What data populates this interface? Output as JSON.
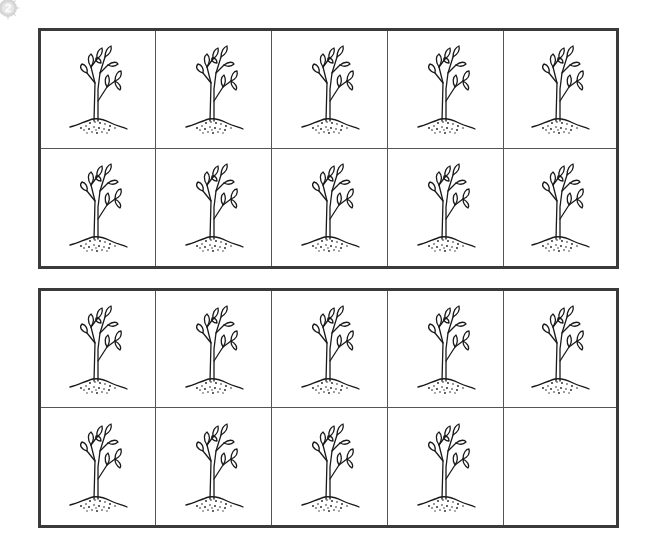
{
  "badge": {
    "label": "2",
    "icon": "sun-badge-icon"
  },
  "frames": [
    {
      "name": "ten-frame-1",
      "cells": [
        {
          "filled": true
        },
        {
          "filled": true
        },
        {
          "filled": true
        },
        {
          "filled": true
        },
        {
          "filled": true
        },
        {
          "filled": true
        },
        {
          "filled": true
        },
        {
          "filled": true
        },
        {
          "filled": true
        },
        {
          "filled": true
        }
      ],
      "count": 10
    },
    {
      "name": "ten-frame-2",
      "cells": [
        {
          "filled": true
        },
        {
          "filled": true
        },
        {
          "filled": true
        },
        {
          "filled": true
        },
        {
          "filled": true
        },
        {
          "filled": true
        },
        {
          "filled": true
        },
        {
          "filled": true
        },
        {
          "filled": true
        },
        {
          "filled": false
        }
      ],
      "count": 9
    }
  ],
  "item_icon": "sapling-plant-icon",
  "total_count": 19,
  "colors": {
    "border": "#3a3a3a",
    "divider": "#555555",
    "ink": "#1a1a1a",
    "badge": "#c8c8c8"
  }
}
